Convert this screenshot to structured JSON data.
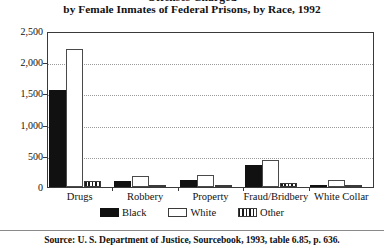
{
  "title": {
    "clipped_line": "Offenses Charged",
    "line": "by Female Inmates of Federal Prisons, by Race, 1992"
  },
  "source": {
    "text": "Source: U. S. Department of Justice, Sourcebook, 1993, table 6.85, p. 636."
  },
  "legend": {
    "items": [
      {
        "label": "Black",
        "swatch": "solid-black-swatch"
      },
      {
        "label": "White",
        "swatch": "outline-white-swatch"
      },
      {
        "label": "Other",
        "swatch": "striped-other-swatch"
      }
    ]
  },
  "axis": {
    "y_ticks": [
      "0",
      "500",
      "1,000",
      "1,500",
      "2,000",
      "2,500"
    ],
    "y_tick_values": [
      0,
      500,
      1000,
      1500,
      2000,
      2500
    ]
  },
  "chart_data": {
    "type": "bar",
    "title": "Offenses Charged by Female Inmates of Federal Prisons, by Race, 1992",
    "subtitle": "",
    "xlabel": "",
    "ylabel": "",
    "ylim": [
      0,
      2500
    ],
    "ytick_values": [
      0,
      500,
      1000,
      1500,
      2000,
      2500
    ],
    "ytick_labels": [
      "0",
      "500",
      "1,000",
      "1,500",
      "2,000",
      "2,500"
    ],
    "grid": true,
    "grid_axis": "y",
    "grid_style": "dotted",
    "legend_position": "below-axes",
    "categories": [
      "Drugs",
      "Robbery",
      "Property",
      "Fraud/Bridbery",
      "White Collar"
    ],
    "series": [
      {
        "name": "Black",
        "values": [
          1550,
          100,
          110,
          350,
          40
        ]
      },
      {
        "name": "White",
        "values": [
          2220,
          170,
          190,
          440,
          110
        ]
      },
      {
        "name": "Other",
        "values": [
          90,
          25,
          30,
          60,
          20
        ]
      }
    ],
    "source": "Source: U. S. Department of Justice, Sourcebook, 1993, table 6.85, p. 636."
  }
}
